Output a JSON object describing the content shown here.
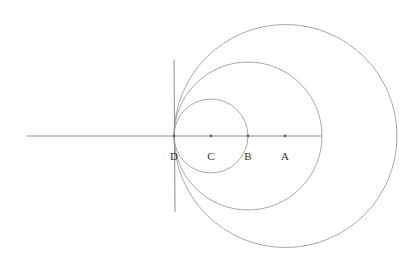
{
  "diagram": {
    "type": "geometry",
    "colors": {
      "line": "#8a8a8a",
      "circle": "#a8a8a8",
      "point": "#666666",
      "label": "#333333"
    },
    "horizontal_line": {
      "x1": 27,
      "y1": 136,
      "x2": 322,
      "y2": 136
    },
    "tangent_line": {
      "x1": 174,
      "y1": 60,
      "x2": 175,
      "y2": 212
    },
    "circles": [
      {
        "name": "small-circle",
        "cx": 211,
        "cy": 136,
        "r": 37
      },
      {
        "name": "medium-circle",
        "cx": 248,
        "cy": 136,
        "r": 74
      },
      {
        "name": "large-circle",
        "cx": 285.5,
        "cy": 136,
        "r": 111.5
      }
    ],
    "points": [
      {
        "id": "D",
        "label": "D",
        "x": 174,
        "y": 136
      },
      {
        "id": "C",
        "label": "C",
        "x": 211,
        "y": 136
      },
      {
        "id": "B",
        "label": "B",
        "x": 248,
        "y": 136
      },
      {
        "id": "A",
        "label": "A",
        "x": 285,
        "y": 136
      }
    ],
    "label_offset_y": 24
  }
}
